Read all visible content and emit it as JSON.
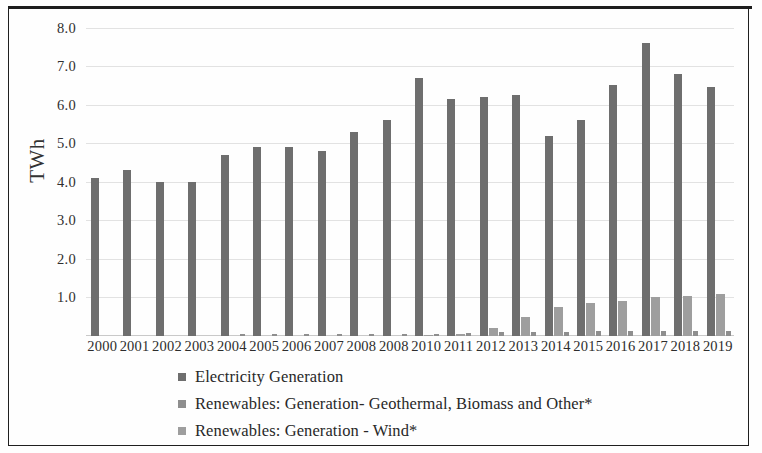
{
  "chart_data": {
    "type": "bar",
    "title": "",
    "subtitle": "",
    "xlabel": "",
    "ylabel": "TWh",
    "ylim": [
      0,
      8.3
    ],
    "grid": true,
    "legend_position": "bottom-left",
    "categories": [
      "2000",
      "2001",
      "2002",
      "2003",
      "2004",
      "2005",
      "2006",
      "2007",
      "2008",
      "2008",
      "2010",
      "2011",
      "2012",
      "2013",
      "2014",
      "2015",
      "2016",
      "2017",
      "2018",
      "2019"
    ],
    "y_ticks": [
      "8.0",
      "7.0",
      "6.0",
      "5.0",
      "4.0",
      "3.0",
      "2.0",
      "1.0"
    ],
    "y_tick_values": [
      8.0,
      7.0,
      6.0,
      5.0,
      4.0,
      3.0,
      2.0,
      1.0
    ],
    "series": [
      {
        "name": "Electricity Generation",
        "color": "#6e6e6e",
        "values": [
          4.1,
          4.3,
          4.0,
          4.0,
          4.7,
          4.9,
          4.9,
          4.8,
          5.3,
          5.6,
          6.7,
          6.15,
          6.2,
          6.25,
          5.2,
          5.6,
          6.5,
          7.6,
          6.8,
          6.45
        ]
      },
      {
        "name": "Renewables: Generation- Geothermal, Biomass and Other*",
        "color": "#8e8e8e",
        "values": [
          0.0,
          0.0,
          0.0,
          0.0,
          0.04,
          0.04,
          0.04,
          0.05,
          0.05,
          0.06,
          0.06,
          0.08,
          0.1,
          0.1,
          0.1,
          0.12,
          0.12,
          0.12,
          0.12,
          0.12
        ]
      },
      {
        "name": "Renewables: Generation - Wind*",
        "color": "#9e9e9e",
        "values": [
          0.0,
          0.0,
          0.0,
          0.0,
          0.0,
          0.0,
          0.0,
          0.0,
          0.0,
          0.0,
          0.02,
          0.05,
          0.22,
          0.5,
          0.75,
          0.85,
          0.92,
          1.0,
          1.05,
          1.1
        ]
      }
    ]
  },
  "axis": {
    "y_title": "TWh"
  },
  "legend": {
    "items": [
      {
        "label": "Electricity Generation",
        "color": "#6e6e6e"
      },
      {
        "label": "Renewables: Generation- Geothermal, Biomass and Other*",
        "color": "#8e8e8e"
      },
      {
        "label": "Renewables: Generation - Wind*",
        "color": "#9e9e9e"
      }
    ]
  }
}
